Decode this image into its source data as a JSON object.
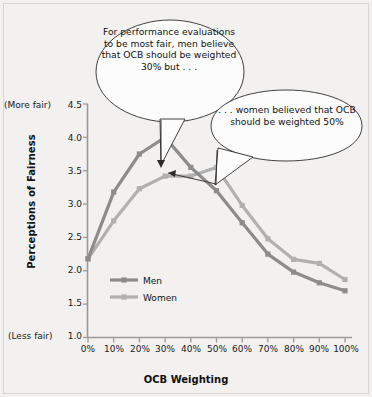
{
  "figure": {
    "background": "#f2f1ef"
  },
  "axes": {
    "y_title": "Perceptions of Fairness",
    "x_title": "OCB Weighting",
    "more_fair_label": "(More fair)",
    "less_fair_label": "(Less fair)",
    "y_ticks": [
      "4.5",
      "4.0",
      "3.5",
      "3.0",
      "2.5",
      "2.0",
      "1.5",
      "1.0"
    ],
    "x_ticks": [
      "0%",
      "10%",
      "20%",
      "30%",
      "40%",
      "50%",
      "60%",
      "70%",
      "80%",
      "90%",
      "100%"
    ]
  },
  "legend": {
    "items": [
      {
        "label": "Men",
        "color": "#8c8c8c"
      },
      {
        "label": "Women",
        "color": "#b0b0b0"
      }
    ]
  },
  "callouts": [
    {
      "name": "men-callout",
      "text": "For performance evaluations\nto be most fair, men believe\nthat OCB should be weighted\n30%  but . . ."
    },
    {
      "name": "women-callout",
      "text": ". . . women believed that OCB\nshould be weighted 50%"
    }
  ],
  "chart_data": {
    "type": "line",
    "title": "",
    "xlabel": "OCB Weighting",
    "ylabel": "Perceptions of Fairness",
    "categories": [
      "0%",
      "10%",
      "20%",
      "30%",
      "40%",
      "50%",
      "60%",
      "70%",
      "80%",
      "90%",
      "100%"
    ],
    "x": [
      0,
      10,
      20,
      30,
      40,
      50,
      60,
      70,
      80,
      90,
      100
    ],
    "ylim": [
      1.0,
      4.5
    ],
    "yticks": [
      1.0,
      1.5,
      2.0,
      2.5,
      3.0,
      3.5,
      4.0,
      4.5
    ],
    "grid": false,
    "legend_position": "inside-lower-left",
    "series": [
      {
        "name": "Men",
        "color": "#8c8c8c",
        "values": [
          2.18,
          3.18,
          3.75,
          4.0,
          3.55,
          3.2,
          2.72,
          2.25,
          1.98,
          1.82,
          1.7
        ]
      },
      {
        "name": "Women",
        "color": "#b0b0b0",
        "values": [
          2.18,
          2.75,
          3.23,
          3.42,
          3.42,
          3.55,
          2.98,
          2.48,
          2.17,
          2.11,
          1.87
        ]
      }
    ],
    "annotations": [
      {
        "text": "For performance evaluations to be most fair, men believe that OCB should be weighted 30%  but . . .",
        "points_to_series": "Men",
        "points_to_x": "30%",
        "points_to_y": 4.0
      },
      {
        "text": ". . . women believed that OCB should be weighted 50%",
        "points_to_series": "Women",
        "points_to_x": "50%",
        "points_to_y": 3.55
      }
    ]
  }
}
